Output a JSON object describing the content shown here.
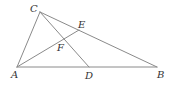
{
  "diagram": {
    "type": "geometry-triangle",
    "points": {
      "A": {
        "label": "A",
        "x": 17,
        "y": 67,
        "lx": 11,
        "ly": 78
      },
      "B": {
        "label": "B",
        "x": 157,
        "y": 67,
        "lx": 157,
        "ly": 78
      },
      "C": {
        "label": "C",
        "x": 40,
        "y": 12,
        "lx": 30,
        "ly": 12
      },
      "D": {
        "label": "D",
        "x": 89,
        "y": 67,
        "lx": 85,
        "ly": 79
      },
      "E": {
        "label": "E",
        "x": 79,
        "y": 30,
        "lx": 78,
        "ly": 28
      },
      "F": {
        "label": "F",
        "x": 63,
        "y": 41,
        "lx": 57,
        "ly": 51
      }
    },
    "segments": [
      {
        "name": "segment-AB",
        "from": "A",
        "to": "B"
      },
      {
        "name": "segment-AC",
        "from": "A",
        "to": "C"
      },
      {
        "name": "segment-CB",
        "from": "C",
        "to": "B"
      },
      {
        "name": "segment-CD",
        "from": "C",
        "to": "D"
      },
      {
        "name": "segment-AE",
        "from": "A",
        "to": "E"
      }
    ],
    "line_color": "#8a8a8a",
    "label_color": "#333333"
  }
}
